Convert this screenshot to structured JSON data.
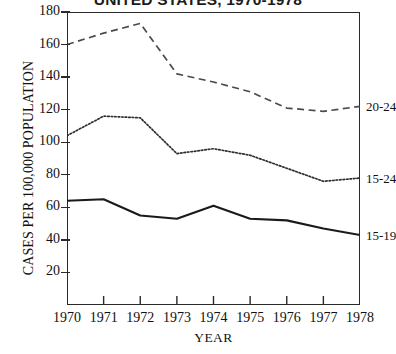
{
  "chart_data": {
    "type": "line",
    "title": "UNITED STATES, 1970-1978",
    "xlabel": "YEAR",
    "ylabel": "CASES PER 100,000 POPULATION",
    "x": [
      1970,
      1971,
      1972,
      1973,
      1974,
      1975,
      1976,
      1977,
      1978
    ],
    "xtick_labels": [
      "1970",
      "1971",
      "1972",
      "1973",
      "1974",
      "1975",
      "1976",
      "1977",
      "1978"
    ],
    "ytick_labels": [
      "20",
      "40",
      "60",
      "80",
      "100",
      "120",
      "140",
      "160",
      "180"
    ],
    "ytick_values": [
      20,
      40,
      60,
      80,
      100,
      120,
      140,
      160,
      180
    ],
    "xlim": [
      1970,
      1978
    ],
    "ylim": [
      0,
      180
    ],
    "grid": false,
    "legend_position": "right-of-axes-endpoint",
    "series": [
      {
        "name": "20-24",
        "label": "20-24",
        "style": "dashed",
        "color": "#4a4a4a",
        "values": [
          160,
          167,
          173,
          142,
          137,
          131,
          121,
          119,
          122
        ]
      },
      {
        "name": "15-24",
        "label": "15-24",
        "style": "dotted",
        "color": "#2f2f2f",
        "values": [
          104,
          116,
          115,
          93,
          96,
          92,
          84,
          76,
          78
        ]
      },
      {
        "name": "15-19",
        "label": "15-19",
        "style": "solid",
        "color": "#1a1a1a",
        "values": [
          64,
          65,
          55,
          53,
          61,
          53,
          52,
          47,
          43
        ]
      }
    ]
  }
}
